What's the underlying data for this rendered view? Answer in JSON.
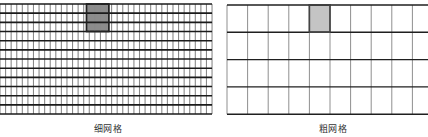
{
  "fine_grid": {
    "label": "细网格",
    "origin": [
      0,
      4
    ],
    "cols": 38,
    "col_width": 5.58,
    "rows": 12,
    "row_height": 9.17,
    "shaded": {
      "col_start": 15.5,
      "col_span": 4,
      "row_start": 0,
      "row_span": 3
    },
    "colors": {
      "h_line": "#1a1a1a",
      "v_line": "#8a8a8a",
      "shade": "#8c8c8c",
      "border": "#222222"
    }
  },
  "coarse_grid": {
    "label": "粗网格",
    "origin": [
      227,
      5
    ],
    "cols": 10,
    "col_width": 20.6,
    "rows": 4,
    "row_height": 27.3,
    "shaded": {
      "col_start": 4,
      "col_span": 1,
      "row_start": 0,
      "row_span": 1
    },
    "colors": {
      "h_line": "#1f1f1f",
      "v_line": "#8f8f8f",
      "shade": "#c4c4c4",
      "border": "#444444"
    }
  }
}
